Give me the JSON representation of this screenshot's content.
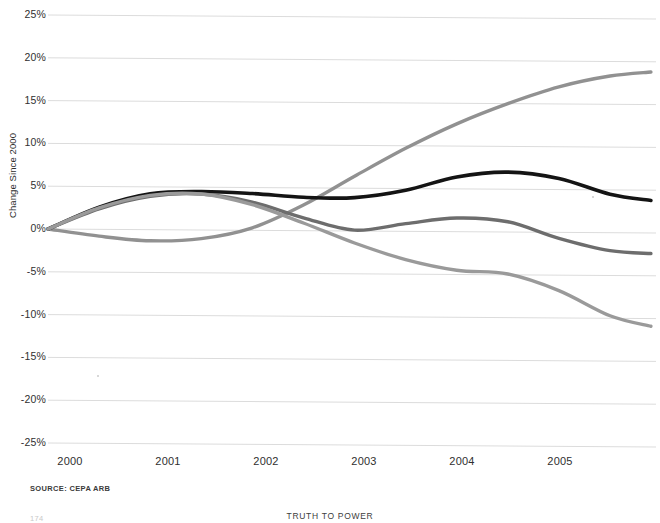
{
  "figure": {
    "y_axis_title": "Change Since 2000",
    "source_note": "SOURCE: CEPA ARB",
    "footer_running_head": "TRUTH TO POWER",
    "footer_page_number": "174"
  },
  "chart_data": {
    "type": "line",
    "title": "",
    "subtitle": "",
    "xlabel": "",
    "ylabel": "Change Since 2000",
    "xlim": [
      2000,
      2005.95
    ],
    "ylim": [
      -25,
      25
    ],
    "grid": true,
    "legend": "none",
    "x_tick_labels": [
      "2000",
      "2001",
      "2002",
      "2003",
      "2004",
      "2005"
    ],
    "x_ticks": [
      2000,
      2001,
      2002,
      2003,
      2004,
      2005
    ],
    "y_tick_labels": [
      "25%",
      "20%",
      "15%",
      "10%",
      "5%",
      "0%",
      "-5%",
      "-10%",
      "-15%",
      "-20%",
      "-25%"
    ],
    "y_ticks": [
      25,
      20,
      15,
      10,
      5,
      0,
      -5,
      -10,
      -15,
      -20,
      -25
    ],
    "y_unit": "%",
    "x": [
      2000,
      2000.5,
      2001,
      2001.5,
      2002,
      2002.5,
      2003,
      2003.5,
      2004,
      2004.5,
      2005,
      2005.5,
      2005.9
    ],
    "series": [
      {
        "name": "steeply-rising-series",
        "color": "#919191",
        "width": 3.4,
        "values": [
          0,
          -0.8,
          -1.3,
          -1.0,
          0.3,
          3.0,
          6.4,
          9.7,
          12.6,
          15.0,
          17.0,
          18.3,
          18.8
        ]
      },
      {
        "name": "black-series",
        "color": "#141414",
        "width": 3.6,
        "values": [
          0,
          2.6,
          4.2,
          4.5,
          4.3,
          3.9,
          3.9,
          4.8,
          6.4,
          7.0,
          6.3,
          4.5,
          3.8
        ]
      },
      {
        "name": "mid-gray-series",
        "color": "#6d6d6d",
        "width": 3.4,
        "values": [
          0,
          2.4,
          3.9,
          4.2,
          3.3,
          1.5,
          0.1,
          0.9,
          1.6,
          1.2,
          -0.7,
          -2.1,
          -2.4
        ]
      },
      {
        "name": "declining-gray-series",
        "color": "#9a9a9a",
        "width": 3.4,
        "values": [
          0,
          2.5,
          4.0,
          4.2,
          3.0,
          0.9,
          -1.4,
          -3.3,
          -4.5,
          -4.9,
          -6.8,
          -9.7,
          -10.9
        ]
      }
    ]
  }
}
